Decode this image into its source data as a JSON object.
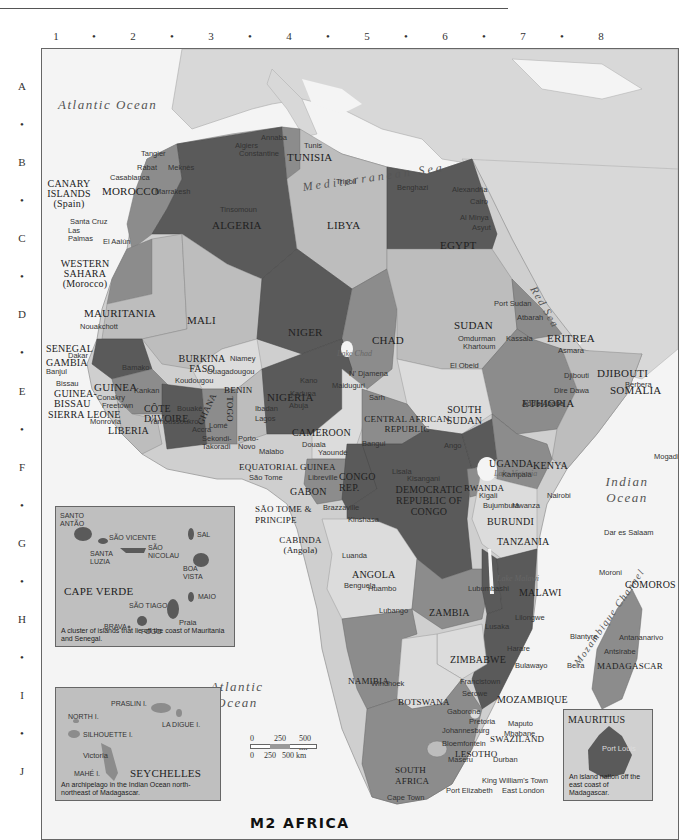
{
  "map": {
    "title": "M2 AFRICA",
    "grid": {
      "columns": [
        "1",
        "2",
        "3",
        "4",
        "5",
        "6",
        "7",
        "8"
      ],
      "rows": [
        "A",
        "B",
        "C",
        "D",
        "E",
        "F",
        "G",
        "H",
        "I",
        "J"
      ],
      "separator": "•"
    },
    "colors": {
      "background_land": "#d8d8d8",
      "water": "#f4f4f4",
      "dark_country": "#5a5a5a",
      "mid_country": "#8c8c8c",
      "light_country": "#bdbdbd",
      "pale_country": "#dcdcdc",
      "inset_bg": "#bfbfbf"
    },
    "oceans": {
      "atlantic_north": "Atlantic Ocean",
      "atlantic_south": "Atlantic Ocean",
      "mediterranean": "Mediterranean Sea",
      "red_sea": "Red Sea",
      "gulf_of_guinea": "Gulf of Guinea",
      "indian": "Indian Ocean",
      "mozambique_channel": "Mozambique Channel"
    },
    "lakes": {
      "chad": "Lake Chad",
      "victoria": "Lake Victoria",
      "malawi": "Lake Malawi"
    },
    "countries": {
      "morocco": "MOROCCO",
      "algeria": "ALGERIA",
      "tunisia": "TUNISIA",
      "libya": "LIBYA",
      "egypt": "EGYPT",
      "canary": "CANARY ISLANDS (Spain)",
      "western_sahara": "WESTERN SAHARA (Morocco)",
      "mauritania": "MAURITANIA",
      "mali": "MALI",
      "niger": "NIGER",
      "chad": "CHAD",
      "sudan": "SUDAN",
      "eritrea": "ERITREA",
      "djibouti": "DJIBOUTI",
      "senegal": "SENEGAL",
      "gambia": "GAMBIA",
      "guinea_bissau": "GUINEA-BISSAU",
      "guinea": "GUINEA",
      "sierra_leone": "SIERRA LEONE",
      "liberia": "LIBERIA",
      "cote_divoire": "CÔTE D'IVOIRE",
      "burkina_faso": "BURKINA FASO",
      "ghana": "GHANA",
      "togo": "TOGO",
      "benin": "BENIN",
      "nigeria": "NIGERIA",
      "cameroon": "CAMEROON",
      "car": "CENTRAL AFRICAN REPUBLIC",
      "south_sudan": "SOUTH SUDAN",
      "ethiopia": "ETHIOPIA",
      "somalia": "SOMALIA",
      "eq_guinea": "EQUATORIAL GUINEA",
      "sao_tome": "SÃO TOME & PRINCIPE",
      "gabon": "GABON",
      "congo_rep": "CONGO REP.",
      "drc": "DEMOCRATIC REPUBLIC OF CONGO",
      "cabinda": "CABINDA (Angola)",
      "uganda": "UGANDA",
      "kenya": "KENYA",
      "rwanda": "RWANDA",
      "burundi": "BURUNDI",
      "tanzania": "TANZANIA",
      "angola": "ANGOLA",
      "zambia": "ZAMBIA",
      "malawi": "MALAWI",
      "comoros": "COMOROS",
      "zimbabwe": "ZIMBABWE",
      "mozambique": "MOZAMBIQUE",
      "madagascar": "MADAGASCAR",
      "namibia": "NAMIBIA",
      "botswana": "BOTSWANA",
      "swaziland": "SWAZILAND",
      "lesotho": "LESOTHO",
      "south_africa": "SOUTH AFRICA"
    },
    "cities": {
      "algiers": "Algiers",
      "annaba": "Annaba",
      "constantine": "Constantine",
      "tunis": "Tunis",
      "tangier": "Tangier",
      "rabat": "Rabat",
      "meknes": "Meknès",
      "casablanca": "Casablanca",
      "marrakesh": "Marrakesh",
      "tindouf": "Tinsomoun",
      "tripoli": "Tripoli",
      "benghazi": "Benghazi",
      "alexandria": "Alexandria",
      "cairo": "Cairo",
      "al_minya": "Al Minya",
      "asyut": "Asyut",
      "santa_cruz": "Santa Cruz",
      "las_palmas": "Las Palmas",
      "el_aaiun": "El Aaiún",
      "nouakchott": "Nouakchott",
      "dakar": "Dakar",
      "banjul": "Banjul",
      "bissau": "Bissau",
      "conakry": "Conakry",
      "freetown": "Freetown",
      "monrovia": "Monrovia",
      "bamako": "Bamako",
      "kankan": "Kankan",
      "ouagadougou": "Ouagadougou",
      "koudougou": "Koudougou",
      "niamey": "Niamey",
      "bouake": "Bouaké",
      "yamoussoukro": "Yamoussoukro",
      "accra": "Accra",
      "lome": "Lomé",
      "sekondi": "Sekondi-Takoradi",
      "porto_novo": "Porto-Novo",
      "kano": "Kano",
      "kaduna": "Kaduna",
      "abuja": "Abuja",
      "ibadan": "Ibadan",
      "lagos": "Lagos",
      "maiduguri": "Maiduguri",
      "ndjamena": "N' Djamena",
      "sarh": "Sarh",
      "malabo": "Malabo",
      "douala": "Douala",
      "yaounde": "Yaoundé",
      "bangui": "Bangui",
      "sao_tome_city": "São Tome",
      "libreville": "Libreville",
      "brazzaville": "Brazzaville",
      "kinshasa": "Kinshasa",
      "kisangani": "Kisangani",
      "lisala": "Lisala",
      "ango": "Ango",
      "port_sudan": "Port Sudan",
      "atbarah": "Atbarah",
      "omdurman": "Omdurman",
      "khartoum": "Khartoum",
      "kassala": "Kassala",
      "el_obeid": "El Obeid",
      "asmara": "Asmara",
      "djibouti_city": "Djibouti",
      "berbera": "Berbera",
      "dire_dawa": "Dire Dawa",
      "addis_ababa": "Addis Ababa",
      "mogadishu": "Mogadishu",
      "kampala": "Kampala",
      "nairobi": "Nairobi",
      "kigali": "Kigali",
      "bujumbura": "Bujumbura",
      "mwanza": "Mwanza",
      "dar_es_salaam": "Dar es Salaam",
      "moroni": "Moroni",
      "luanda": "Luanda",
      "benguela": "Benguela",
      "huambo": "Huambo",
      "lubango": "Lubango",
      "lubumbashi": "Lubumbashi",
      "lusaka": "Lusaka",
      "lilongwe": "Lilongwe",
      "blantyre": "Blantyre",
      "harare": "Harare",
      "bulawayo": "Bulawayo",
      "beira": "Beira",
      "antananarivo": "Antananarivo",
      "antsirabe": "Antsirabe",
      "francistown": "Francistown",
      "serowe": "Serowe",
      "gaborone": "Gaborone",
      "windhoek": "Windhoek",
      "pretoria": "Pretoria",
      "johannesburg": "Johannesburg",
      "maputo": "Maputo",
      "mbabane": "Mbabane",
      "bloemfontein": "Bloemfontein",
      "maseru": "Maseru",
      "durban": "Durban",
      "king_williams": "King William's Town",
      "east_london": "East London",
      "port_elizabeth": "Port Elizabeth",
      "cape_town": "Cape Town"
    },
    "scale": {
      "mi_labels": [
        "0",
        "250",
        "500 mi"
      ],
      "km_labels": [
        "0",
        "250",
        "500 km"
      ]
    },
    "insets": {
      "cape_verde": {
        "title": "CAPE VERDE",
        "islands": [
          "SANTO ANTÃO",
          "SÃO VICENTE",
          "SANTA LUZIA",
          "SÃO NICOLAU",
          "SAL",
          "BOA VISTA",
          "MAIO",
          "SÃO TIAGO",
          "BRAVA",
          "FOGO"
        ],
        "city": "Praia",
        "caption": "A cluster of islands that lie off the coast of Mauritania and Senegal."
      },
      "seychelles": {
        "title": "SEYCHELLES",
        "islands": [
          "PRASLIN I.",
          "NORTH I.",
          "LA DIGUE I.",
          "SILHOUETTE I.",
          "MAHÉ I."
        ],
        "city": "Victoria",
        "caption": "An archipelago in the Indian Ocean north-northeast of Madagascar."
      },
      "mauritius": {
        "title": "MAURITIUS",
        "city": "Port Louis",
        "caption": "An island nation off the east coast of Madagascar."
      }
    }
  }
}
